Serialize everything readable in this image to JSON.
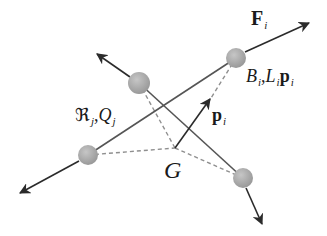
{
  "figure": {
    "colors": {
      "background": "#ffffff",
      "node_fill": "#a8a8a8",
      "node_highlight": "#c6c6c6",
      "bar": "#555555",
      "dashed": "#8f8f8f",
      "arrow": "#2b2b2b",
      "text": "#1a1a1a"
    },
    "center": {
      "name": "G",
      "x": 175,
      "y": 148
    },
    "nodes": [
      {
        "id": "node-top-right",
        "x": 236,
        "y": 58,
        "r": 10
      },
      {
        "id": "node-upper-left",
        "x": 139,
        "y": 83,
        "r": 11
      },
      {
        "id": "node-lower-left",
        "x": 88,
        "y": 155,
        "r": 10
      },
      {
        "id": "node-bottom-right",
        "x": 243,
        "y": 178,
        "r": 10
      }
    ],
    "bars": [
      {
        "from": "node-lower-left",
        "to": "node-top-right"
      },
      {
        "from": "node-upper-left",
        "to": "node-bottom-right"
      }
    ],
    "dashed_links": [
      {
        "from": "node-top-right",
        "to": "G"
      },
      {
        "from": "node-upper-left",
        "to": "G"
      },
      {
        "from": "node-lower-left",
        "to": "G"
      },
      {
        "from": "node-bottom-right",
        "to": "G"
      }
    ],
    "arrows": [
      {
        "id": "force-top-right",
        "from": [
          245,
          52
        ],
        "to": [
          309,
          23
        ]
      },
      {
        "id": "force-upper-left",
        "from": [
          130,
          77
        ],
        "to": [
          97,
          54
        ]
      },
      {
        "id": "force-lower-left",
        "from": [
          79,
          161
        ],
        "to": [
          20,
          193
        ]
      },
      {
        "id": "force-bottom-right",
        "from": [
          246,
          188
        ],
        "to": [
          262,
          224
        ]
      },
      {
        "id": "vector-p-i",
        "from": [
          175,
          148
        ],
        "to": [
          210,
          99
        ]
      }
    ],
    "labels": {
      "force": {
        "main": "F",
        "sub": "i"
      },
      "node_props": {
        "b": "B",
        "b_sub": "i",
        "comma": ",",
        "l": "L",
        "l_sub": "i",
        "p": "p",
        "p_sub": "i"
      },
      "bar_props": {
        "r": "ℜ",
        "r_sub": "j",
        "comma": ",",
        "q": "Q",
        "q_sub": "j"
      },
      "position_vector": {
        "main": "p",
        "sub": "i"
      },
      "center": "G"
    }
  }
}
